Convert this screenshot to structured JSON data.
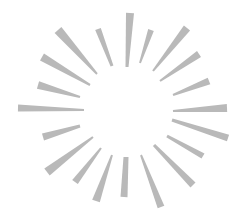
{
  "graphic": {
    "label": "Sunburst illustration",
    "ray_color": "#b9b9b9",
    "background_color": "#ffffff",
    "rays": [
      {
        "outer": [
          130,
          13
        ],
        "inner": [
          127,
          67
        ],
        "w_outer": 8,
        "w_inner": 3
      },
      {
        "outer": [
          151,
          30
        ],
        "inner": [
          140,
          63
        ],
        "w_outer": 6,
        "w_inner": 2
      },
      {
        "outer": [
          187,
          28
        ],
        "inner": [
          153,
          71
        ],
        "w_outer": 8,
        "w_inner": 2
      },
      {
        "outer": [
          199,
          54
        ],
        "inner": [
          160,
          81
        ],
        "w_outer": 7,
        "w_inner": 2
      },
      {
        "outer": [
          209,
          81
        ],
        "inner": [
          173,
          95
        ],
        "w_outer": 7,
        "w_inner": 2
      },
      {
        "outer": [
          227,
          108
        ],
        "inner": [
          173,
          111
        ],
        "w_outer": 8,
        "w_inner": 2
      },
      {
        "outer": [
          228,
          138
        ],
        "inner": [
          172,
          120
        ],
        "w_outer": 7,
        "w_inner": 3
      },
      {
        "outer": [
          203,
          156
        ],
        "inner": [
          167,
          136
        ],
        "w_outer": 6,
        "w_inner": 3
      },
      {
        "outer": [
          193,
          185
        ],
        "inner": [
          154,
          145
        ],
        "w_outer": 7,
        "w_inner": 3
      },
      {
        "outer": [
          161,
          207
        ],
        "inner": [
          141,
          155
        ],
        "w_outer": 7,
        "w_inner": 2
      },
      {
        "outer": [
          124,
          197
        ],
        "inner": [
          126,
          157
        ],
        "w_outer": 7,
        "w_inner": 5
      },
      {
        "outer": [
          96,
          201
        ],
        "inner": [
          112,
          155
        ],
        "w_outer": 8,
        "w_inner": 2
      },
      {
        "outer": [
          75,
          182
        ],
        "inner": [
          101,
          148
        ],
        "w_outer": 7,
        "w_inner": 2
      },
      {
        "outer": [
          47,
          172
        ],
        "inner": [
          93,
          137
        ],
        "w_outer": 9,
        "w_inner": 2
      },
      {
        "outer": [
          43,
          137
        ],
        "inner": [
          80,
          126
        ],
        "w_outer": 7,
        "w_inner": 3
      },
      {
        "outer": [
          18,
          108
        ],
        "inner": [
          84,
          110
        ],
        "w_outer": 7,
        "w_inner": 2
      },
      {
        "outer": [
          38,
          85
        ],
        "inner": [
          80,
          97
        ],
        "w_outer": 8,
        "w_inner": 2
      },
      {
        "outer": [
          42,
          57
        ],
        "inner": [
          90,
          85
        ],
        "w_outer": 8,
        "w_inner": 2
      },
      {
        "outer": [
          58,
          30
        ],
        "inner": [
          97,
          74
        ],
        "w_outer": 9,
        "w_inner": 2
      },
      {
        "outer": [
          98,
          29
        ],
        "inner": [
          112,
          66
        ],
        "w_outer": 6,
        "w_inner": 3
      }
    ]
  }
}
